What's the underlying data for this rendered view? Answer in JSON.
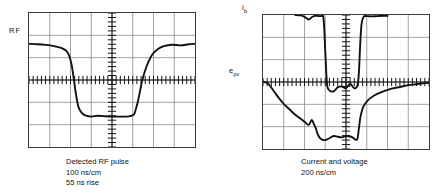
{
  "figure": {
    "background": "#ffffff",
    "trace_color": "#111111",
    "grid_color": "#8c8c8c",
    "border_color": "#3a3a3a"
  },
  "panels": [
    {
      "id": "left",
      "axis_labels": [
        {
          "name": "rf-label",
          "text": "RF",
          "sub": ""
        }
      ],
      "caption": {
        "line1": "Detected RF pulse",
        "line2": "100 ns/cm",
        "line3": "55 ns rise"
      }
    },
    {
      "id": "right",
      "axis_labels": [
        {
          "name": "ib-label",
          "text": "i",
          "sub": "b"
        },
        {
          "name": "epv-label",
          "text": "e",
          "sub": "pv"
        }
      ],
      "caption": {
        "line1": "Current and voltage",
        "line2": "200 ns/cm",
        "line3": ""
      }
    }
  ],
  "chart_data": [
    {
      "type": "line",
      "title": "Detected RF pulse",
      "xlabel": "100 ns/cm",
      "ylabel": "RF",
      "timebase": "100 ns/cm",
      "rise_time": "55 ns rise",
      "grid": {
        "divisions_x": 8,
        "divisions_y": 6,
        "minor_ticks_per_div": 5
      },
      "xlim": [
        0,
        8
      ],
      "ylim": [
        0,
        6
      ],
      "series": [
        {
          "name": "RF",
          "x": [
            0.0,
            0.4,
            0.8,
            1.2,
            1.55,
            1.8,
            1.95,
            2.05,
            2.12,
            2.18,
            2.25,
            2.32,
            2.4,
            2.55,
            2.75,
            3.0,
            3.3,
            3.6,
            4.0,
            4.4,
            4.8,
            5.05,
            5.15,
            5.25,
            5.35,
            5.45,
            5.58,
            5.75,
            5.95,
            6.2,
            6.5,
            6.9,
            7.3,
            7.7,
            8.0
          ],
          "y": [
            4.62,
            4.6,
            4.57,
            4.52,
            4.44,
            4.3,
            4.05,
            3.7,
            3.3,
            2.9,
            2.45,
            2.05,
            1.75,
            1.52,
            1.4,
            1.36,
            1.4,
            1.38,
            1.36,
            1.36,
            1.37,
            1.45,
            1.7,
            2.05,
            2.5,
            2.95,
            3.38,
            3.8,
            4.15,
            4.38,
            4.52,
            4.58,
            4.55,
            4.6,
            4.62
          ]
        }
      ]
    },
    {
      "type": "line",
      "title": "Current and voltage",
      "xlabel": "200 ns/cm",
      "ylabel": "",
      "timebase": "200 ns/cm",
      "grid": {
        "divisions_x": 8,
        "divisions_y": 6,
        "minor_ticks_per_div": 5
      },
      "xlim": [
        0,
        8
      ],
      "ylim": [
        0,
        6
      ],
      "series": [
        {
          "name": "i_b",
          "x": [
            1.55,
            1.8,
            2.0,
            2.2,
            2.35,
            2.45,
            2.55,
            2.62,
            2.7,
            2.8,
            2.9,
            2.95,
            3.0,
            3.05,
            3.1,
            3.2,
            3.4,
            3.6,
            3.8,
            4.0,
            4.2,
            4.4,
            4.55,
            4.62,
            4.68,
            4.75,
            4.85,
            5.0,
            5.2,
            5.5,
            5.8,
            6.0
          ],
          "y": [
            6.0,
            5.98,
            5.92,
            5.8,
            5.9,
            5.95,
            5.96,
            5.96,
            5.95,
            5.95,
            5.94,
            5.4,
            4.4,
            3.4,
            2.8,
            2.62,
            2.58,
            2.76,
            2.8,
            2.72,
            2.92,
            2.72,
            2.84,
            3.4,
            4.6,
            5.6,
            5.92,
            5.95,
            5.94,
            5.95,
            5.96,
            5.96
          ]
        },
        {
          "name": "e_pv",
          "x": [
            0.0,
            0.25,
            0.5,
            0.75,
            1.0,
            1.25,
            1.5,
            1.75,
            2.0,
            2.2,
            2.35,
            2.45,
            2.55,
            2.62,
            2.72,
            2.85,
            3.0,
            3.2,
            3.4,
            3.6,
            3.8,
            4.0,
            4.2,
            4.35,
            4.45,
            4.55,
            4.62,
            4.7,
            4.85,
            5.1,
            5.4,
            5.8,
            6.2,
            6.7,
            7.2,
            7.7,
            8.0
          ],
          "y": [
            3.02,
            2.92,
            2.62,
            2.3,
            2.02,
            1.8,
            1.58,
            1.4,
            1.22,
            1.08,
            1.3,
            1.12,
            0.92,
            0.7,
            0.52,
            0.42,
            0.4,
            0.48,
            0.58,
            0.55,
            0.52,
            0.58,
            0.56,
            0.5,
            0.42,
            0.46,
            0.9,
            1.45,
            1.92,
            2.22,
            2.42,
            2.58,
            2.7,
            2.8,
            2.88,
            2.94,
            2.97
          ]
        }
      ]
    }
  ]
}
